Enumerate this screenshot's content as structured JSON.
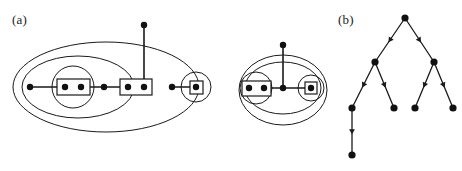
{
  "figure": {
    "background_color": "#ffffff",
    "ink_color": "#1a1a1a",
    "node_color": "#111111",
    "width": 462,
    "height": 171,
    "panels": [
      {
        "id": "a",
        "label": "(a)",
        "label_x": 12,
        "label_y": 12,
        "kind": "nested-set-hypergraph-diagram"
      },
      {
        "id": "b",
        "label": "(b)",
        "label_x": 338,
        "label_y": 12,
        "kind": "directed-binary-tree"
      }
    ]
  },
  "chart_data": {
    "type": "diagram",
    "title": "",
    "panel_a": {
      "description": "Nested ellipse set system with vertices, paired boxes and a pendant vertex",
      "outer_ellipses": [
        {
          "name": "outer-ellipse-left",
          "cx": 106,
          "cy": 87,
          "rx": 93,
          "ry": 45
        },
        {
          "name": "mid-ellipse-left",
          "cx": 78,
          "cy": 87,
          "rx": 56,
          "ry": 31
        },
        {
          "name": "inner-circle-left",
          "cx": 73,
          "cy": 87,
          "rx": 21,
          "ry": 21
        },
        {
          "name": "circle-right-singleton",
          "cx": 196,
          "cy": 87,
          "rx": 15,
          "ry": 15
        },
        {
          "name": "outer-ellipse-middle",
          "cx": 283,
          "cy": 90,
          "rx": 44,
          "ry": 35
        },
        {
          "name": "inner-ellipse-middle",
          "cx": 283,
          "cy": 88,
          "rx": 38,
          "ry": 26
        },
        {
          "name": "circle-middle-pair",
          "cx": 256,
          "cy": 88,
          "rx": 16,
          "ry": 16
        },
        {
          "name": "circle-middle-singleton",
          "cx": 311,
          "cy": 88,
          "rx": 13,
          "ry": 13
        }
      ],
      "boxes": [
        {
          "name": "box-pair-left",
          "x": 57,
          "y": 79,
          "w": 33,
          "h": 16,
          "dots": 2
        },
        {
          "name": "box-pair-center",
          "x": 120,
          "y": 79,
          "w": 32,
          "h": 16,
          "dots": 2
        },
        {
          "name": "box-singleton-right",
          "x": 190,
          "y": 81,
          "w": 13,
          "h": 13,
          "dots": 1
        },
        {
          "name": "box-pair-middle-group",
          "x": 242,
          "y": 81,
          "w": 29,
          "h": 15,
          "dots": 2
        },
        {
          "name": "box-singleton-middle-group",
          "x": 305,
          "y": 82,
          "w": 12,
          "h": 12,
          "dots": 1
        }
      ],
      "vertices": [
        {
          "name": "vertex-left-outer",
          "x": 30,
          "y": 87
        },
        {
          "name": "vertex-box-left-a",
          "x": 65,
          "y": 87
        },
        {
          "name": "vertex-box-left-b",
          "x": 81,
          "y": 87
        },
        {
          "name": "vertex-mid-left",
          "x": 104,
          "y": 87
        },
        {
          "name": "vertex-box-center-a",
          "x": 128,
          "y": 87
        },
        {
          "name": "vertex-box-center-b",
          "x": 144,
          "y": 87
        },
        {
          "name": "vertex-pendant-top",
          "x": 144,
          "y": 25
        },
        {
          "name": "vertex-right-free",
          "x": 172,
          "y": 87
        },
        {
          "name": "vertex-right-boxed",
          "x": 196,
          "y": 87
        },
        {
          "name": "vertex-mid-box-a",
          "x": 249,
          "y": 88
        },
        {
          "name": "vertex-mid-box-b",
          "x": 264,
          "y": 88
        },
        {
          "name": "vertex-mid-center",
          "x": 283,
          "y": 88
        },
        {
          "name": "vertex-mid-pendant-top",
          "x": 283,
          "y": 45
        },
        {
          "name": "vertex-mid-boxed",
          "x": 311,
          "y": 88
        }
      ],
      "edges": [
        {
          "from": "vertex-left-outer",
          "to": "vertex-box-left-a"
        },
        {
          "from": "vertex-box-left-b",
          "to": "vertex-mid-left"
        },
        {
          "from": "vertex-mid-left",
          "to": "vertex-box-center-a"
        },
        {
          "from": "vertex-box-center-b",
          "to": "vertex-pendant-top"
        },
        {
          "from": "vertex-right-free",
          "to": "vertex-right-boxed"
        },
        {
          "from": "vertex-mid-box-b",
          "to": "vertex-mid-center"
        },
        {
          "from": "vertex-mid-center",
          "to": "vertex-mid-boxed"
        },
        {
          "from": "vertex-mid-center",
          "to": "vertex-mid-pendant-top"
        }
      ]
    },
    "panel_b": {
      "description": "Directed binary tree, edges drawn with midpoint arrowheads pointing away from the root",
      "root": "n0",
      "nodes": [
        {
          "name": "n0",
          "x": 405,
          "y": 18,
          "level": 0
        },
        {
          "name": "n1",
          "x": 375,
          "y": 62,
          "level": 1
        },
        {
          "name": "n2",
          "x": 434,
          "y": 62,
          "level": 1
        },
        {
          "name": "n3",
          "x": 352,
          "y": 108,
          "level": 2
        },
        {
          "name": "n4",
          "x": 394,
          "y": 108,
          "level": 2
        },
        {
          "name": "n5",
          "x": 415,
          "y": 108,
          "level": 2
        },
        {
          "name": "n6",
          "x": 453,
          "y": 108,
          "level": 2
        },
        {
          "name": "n7",
          "x": 352,
          "y": 155,
          "level": 3
        }
      ],
      "edges": [
        {
          "from": "n0",
          "to": "n1",
          "arrow": "midpoint"
        },
        {
          "from": "n0",
          "to": "n2",
          "arrow": "midpoint"
        },
        {
          "from": "n1",
          "to": "n3",
          "arrow": "midpoint"
        },
        {
          "from": "n1",
          "to": "n4",
          "arrow": "midpoint"
        },
        {
          "from": "n2",
          "to": "n5",
          "arrow": "midpoint"
        },
        {
          "from": "n2",
          "to": "n6",
          "arrow": "midpoint"
        },
        {
          "from": "n3",
          "to": "n7",
          "arrow": "midpoint"
        }
      ],
      "node_count": 8,
      "edge_count": 7,
      "depth": 3
    }
  }
}
